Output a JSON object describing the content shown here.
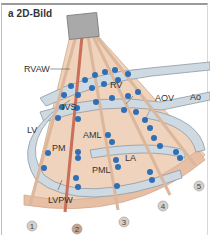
{
  "panel": {
    "letter": "a",
    "title": "a 2D-Bild"
  },
  "labels": {
    "rvaw": "RVAW",
    "rv": "RV",
    "ivs": "IVS",
    "aov": "AOV",
    "ao": "Ao",
    "lv": "LV",
    "aml": "AML",
    "pm": "PM",
    "la": "LA",
    "pml": "PML",
    "lvpw": "LVPW"
  },
  "scan_lines": [
    "1",
    "2",
    "3",
    "4",
    "5"
  ],
  "colors": {
    "sector_fill": "#efd3bd",
    "sector_edge": "#d9b59a",
    "heart_wall": "#cfd9e2",
    "heart_wall_edge": "#8b9aa6",
    "echo_dot": "#2f6fb5",
    "highlight_line": "#c9705a",
    "transducer": "#a9a9a9"
  }
}
